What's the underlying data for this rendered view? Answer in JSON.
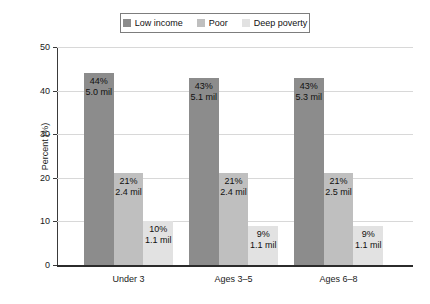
{
  "legend": {
    "entries": [
      {
        "label": "Low income",
        "color": "#8c8c8c",
        "icon": "legend-swatch-icon"
      },
      {
        "label": "Poor",
        "color": "#bfbfbf",
        "icon": "legend-swatch-icon"
      },
      {
        "label": "Deep poverty",
        "color": "#e2e2e2",
        "icon": "legend-swatch-icon"
      }
    ]
  },
  "axes": {
    "ylabel": "Percent (%)",
    "yticks": [
      "0",
      "10",
      "20",
      "30",
      "40",
      "50"
    ],
    "xticks": [
      "Under 3",
      "Ages 3–5",
      "Ages 6–8"
    ]
  },
  "chart_data": {
    "type": "bar",
    "title": "",
    "xlabel": "",
    "ylabel": "Percent (%)",
    "ylim": [
      0,
      50
    ],
    "ytick_values": [
      0,
      10,
      20,
      30,
      40,
      50
    ],
    "grid": true,
    "legend_position": "top-center",
    "categories": [
      "Under 3",
      "Ages 3–5",
      "Ages 6–8"
    ],
    "series": [
      {
        "name": "Low income",
        "color": "#8c8c8c",
        "values": [
          44,
          43,
          43
        ],
        "labels_pct": [
          "44%",
          "43%",
          "43%"
        ],
        "labels_count": [
          "5.0 mil",
          "5.1 mil",
          "5.3 mil"
        ]
      },
      {
        "name": "Poor",
        "color": "#bfbfbf",
        "values": [
          21,
          21,
          21
        ],
        "labels_pct": [
          "21%",
          "21%",
          "21%"
        ],
        "labels_count": [
          "2.4 mil",
          "2.4 mil",
          "2.5 mil"
        ]
      },
      {
        "name": "Deep poverty",
        "color": "#e2e2e2",
        "values": [
          10,
          9,
          9
        ],
        "labels_pct": [
          "10%",
          "9%",
          "9%"
        ],
        "labels_count": [
          "1.1 mil",
          "1.1 mil",
          "1.1 mil"
        ]
      }
    ]
  }
}
